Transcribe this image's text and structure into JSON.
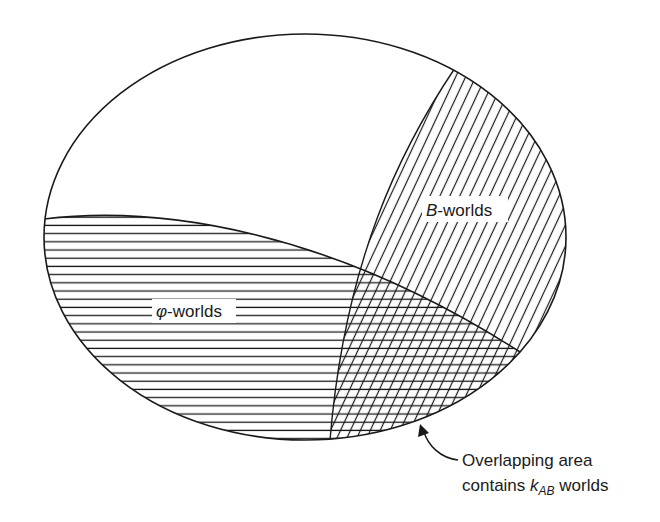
{
  "diagram": {
    "type": "venn-ellipse",
    "colors": {
      "stroke": "#1a1a1a",
      "background": "#ffffff"
    },
    "regions": {
      "universe": {
        "name": "all worlds (outer ellipse)"
      },
      "phi": {
        "label_symbol": "φ",
        "label_suffix": "-worlds",
        "hatch": "horizontal"
      },
      "b": {
        "label_symbol": "B",
        "label_suffix": "-worlds",
        "hatch": "diagonal"
      },
      "overlap": {
        "hatch": "cross-hatch"
      }
    },
    "annotation": {
      "line1": "Overlapping area",
      "line2_prefix": "contains ",
      "line2_var": "k",
      "line2_sub": "AB",
      "line2_suffix": " worlds"
    }
  }
}
